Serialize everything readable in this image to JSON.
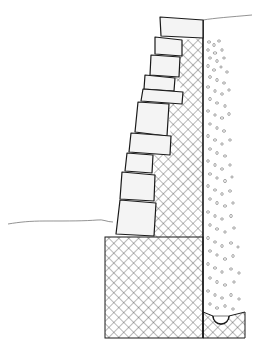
{
  "diagram": {
    "colors": {
      "background": "#ffffff",
      "stroke": "#1a1a1a",
      "block_fill": "#f4f4f4",
      "hatch": "#3a3a3a",
      "gravel": "#6a6a6a",
      "ground": "#777777"
    },
    "components": [
      {
        "id": "retaining-blocks",
        "label": "Stacked retaining wall blocks",
        "count": 11
      },
      {
        "id": "crosshatch-backfill",
        "label": "Compacted fill behind blocks"
      },
      {
        "id": "gravel-drainage",
        "label": "Gravel drainage zone"
      },
      {
        "id": "footing",
        "label": "Base footing"
      },
      {
        "id": "drain-pipe",
        "label": "Perforated drain pipe"
      },
      {
        "id": "grade-upper",
        "label": "Upper ground line"
      },
      {
        "id": "grade-lower",
        "label": "Lower ground line"
      }
    ],
    "blocks": [
      {
        "x1": 160,
        "y1": 17,
        "x2": 203,
        "y2": 20,
        "x3": 203,
        "y3": 38,
        "x4": 161,
        "y4": 36
      },
      {
        "x1": 155,
        "y1": 37,
        "x2": 182,
        "y2": 40,
        "x3": 182,
        "y3": 56,
        "x4": 155,
        "y4": 54
      },
      {
        "x1": 151,
        "y1": 55,
        "x2": 180,
        "y2": 57,
        "x3": 179,
        "y3": 77,
        "x4": 150,
        "y4": 75
      },
      {
        "x1": 145,
        "y1": 75,
        "x2": 175,
        "y2": 78,
        "x3": 174,
        "y3": 91,
        "x4": 144,
        "y4": 89
      },
      {
        "x1": 143,
        "y1": 89,
        "x2": 183,
        "y2": 92,
        "x3": 182,
        "y3": 104,
        "x4": 141,
        "y4": 101
      },
      {
        "x1": 138,
        "y1": 102,
        "x2": 169,
        "y2": 104,
        "x3": 167,
        "y3": 136,
        "x4": 135,
        "y4": 132
      },
      {
        "x1": 131,
        "y1": 133,
        "x2": 171,
        "y2": 136,
        "x3": 170,
        "y3": 155,
        "x4": 129,
        "y4": 152
      },
      {
        "x1": 127,
        "y1": 153,
        "x2": 153,
        "y2": 155,
        "x3": 152,
        "y3": 173,
        "x4": 125,
        "y4": 171
      },
      {
        "x1": 122,
        "y1": 172,
        "x2": 155,
        "y2": 175,
        "x3": 154,
        "y3": 201,
        "x4": 120,
        "y4": 199
      },
      {
        "x1": 120,
        "y1": 200,
        "x2": 156,
        "y2": 203,
        "x3": 154,
        "y3": 232,
        "x4": 116,
        "y4": 229
      },
      {
        "x1": 115,
        "y1": 228,
        "x2": 154,
        "y2": 231,
        "x3": 153,
        "y3": 237,
        "x4": 113,
        "y4": 237
      }
    ],
    "footing": {
      "x": 105,
      "y": 237,
      "w": 98,
      "h": 101
    },
    "drain": {
      "cx": 221,
      "cy": 322,
      "r": 8
    }
  }
}
